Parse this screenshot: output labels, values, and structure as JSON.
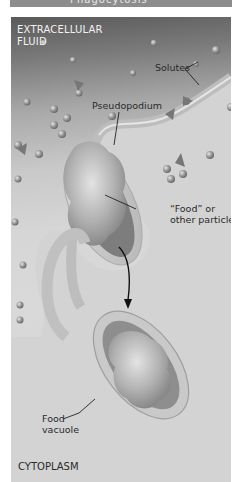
{
  "header": {
    "partial_title": "Phagocytosis"
  },
  "diagram": {
    "title": "Phagocytosis",
    "regions": {
      "top": "EXTRACELLULAR\nFLUID",
      "top_line1": "EXTRACELLULAR",
      "top_line2": "FLUID",
      "bottom": "CYTOPLASM"
    },
    "labels": {
      "solutes": "Solutes",
      "pseudopodium": "Pseudopodium",
      "food_line1": "“Food” or",
      "food_line2": "other particle",
      "vacuole_line1": "Food",
      "vacuole_line2": "vacuole"
    },
    "colors": {
      "frame_top": "#5a5a5a",
      "frame_bottom": "#d8d8d8",
      "membrane": "#c4c4c4",
      "particle": "#9a9a9a",
      "text_dark": "#2a2a2a",
      "text_light": "#f2f2f2"
    },
    "elements": [
      "solute-spheres",
      "solute-triangles",
      "pseudopodium",
      "food-particle",
      "arrow",
      "food-vacuole"
    ]
  }
}
